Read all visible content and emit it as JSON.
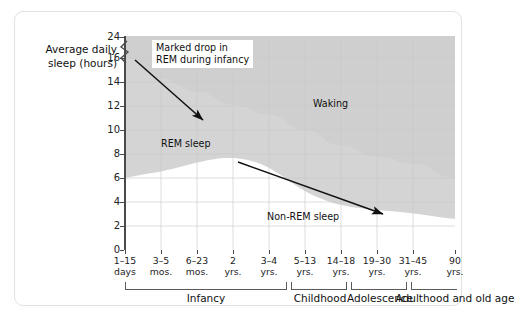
{
  "chart_data": {
    "type": "area",
    "title": "",
    "ylabel": "Average daily sleep (hours)",
    "xlabel": "",
    "grid": true,
    "legend_position": "inline-labels",
    "ylim": [
      0,
      24
    ],
    "y_ticks": [
      "0",
      "2",
      "4",
      "6",
      "8",
      "10",
      "12",
      "14",
      "16",
      "24"
    ],
    "y_axis_break": {
      "between": [
        "16",
        "24"
      ],
      "symbol": "zigzag"
    },
    "categories": [
      "1–15 days",
      "3–5 mos.",
      "6–23 mos.",
      "2 yrs.",
      "3–4 yrs.",
      "5–13 yrs.",
      "14–18 yrs.",
      "19–30 yrs.",
      "31–45 yrs.",
      "90 yrs."
    ],
    "x_tick_labels": [
      {
        "line1": "1–15",
        "line2": "days"
      },
      {
        "line1": "3–5",
        "line2": "mos."
      },
      {
        "line1": "6–23",
        "line2": "mos."
      },
      {
        "line1": "2",
        "line2": "yrs."
      },
      {
        "line1": "3–4",
        "line2": "yrs."
      },
      {
        "line1": "5–13",
        "line2": "yrs."
      },
      {
        "line1": "14–18",
        "line2": "yrs."
      },
      {
        "line1": "19–30",
        "line2": "yrs."
      },
      {
        "line1": "31–45",
        "line2": "yrs."
      },
      {
        "line1": "90",
        "line2": "yrs."
      }
    ],
    "series": [
      {
        "name": "Non-REM sleep",
        "color": "#ffffff",
        "values": [
          8.0,
          8.3,
          8.6,
          8.8,
          8.5,
          7.6,
          6.6,
          5.8,
          5.3,
          4.6
        ]
      },
      {
        "name": "REM sleep",
        "color": "#d2d2d2",
        "values": [
          8.0,
          6.0,
          4.6,
          3.3,
          2.8,
          2.4,
          2.1,
          2.0,
          1.9,
          1.4
        ]
      },
      {
        "name": "Waking",
        "color": "#d2d2d2",
        "values": [
          8.0,
          9.7,
          10.8,
          11.9,
          12.7,
          14.0,
          15.3,
          16.2,
          16.8,
          18.0
        ]
      }
    ],
    "region_labels": [
      {
        "text": "Waking",
        "x_pct": 58,
        "y_pct": 30
      },
      {
        "text": "REM sleep",
        "x_pct": 14,
        "y_pct": 50
      },
      {
        "text": "Non-REM sleep",
        "x_pct": 52,
        "y_pct": 85
      }
    ],
    "annotations": [
      {
        "text_line1": "Marked drop in",
        "text_line2": "REM during infancy",
        "arrow": "points down-right to REM band in infancy"
      },
      {
        "arrow": "points down-right along Non-REM upper boundary"
      }
    ],
    "life_stages": [
      {
        "label": "Infancy"
      },
      {
        "label": "Childhood"
      },
      {
        "label": "Adolescence"
      },
      {
        "label": "Adulthood and old age"
      }
    ]
  }
}
